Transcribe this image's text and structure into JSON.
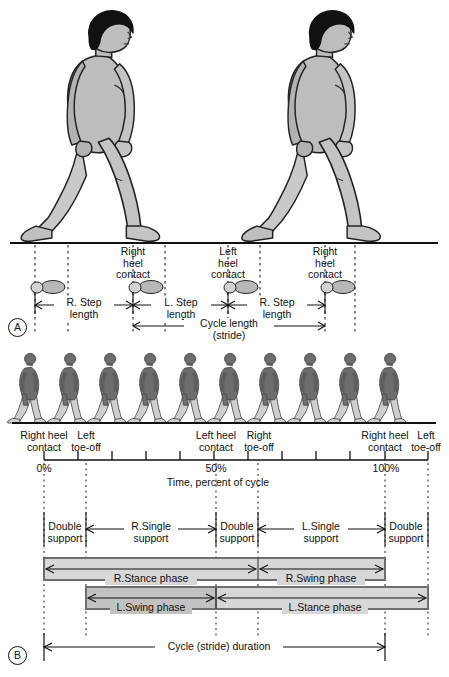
{
  "figure": {
    "panels": [
      {
        "letter": "A",
        "name": "spatial-gait-parameters"
      },
      {
        "letter": "B",
        "name": "temporal-gait-parameters"
      }
    ]
  },
  "panel_a": {
    "letter": "A",
    "event_labels": [
      {
        "text": "Right\nheel\ncontact",
        "x": 133
      },
      {
        "text": "Left\nheel\ncontact",
        "x": 228
      },
      {
        "text": "Right\nheel\ncontact",
        "x": 325
      }
    ],
    "measures": [
      {
        "label": "R. Step\nlength",
        "x1": 35,
        "x2": 133
      },
      {
        "label": "L. Step\nlength",
        "x1": 133,
        "x2": 228
      },
      {
        "label": "R. Step\nlength",
        "x1": 228,
        "x2": 325
      }
    ],
    "cycle": {
      "label": "Cycle length\n(stride)",
      "x1": 133,
      "x2": 325
    },
    "figure_count": 3,
    "footprint_count": 4,
    "dashed_lines": [
      35,
      68,
      133,
      165,
      228,
      260,
      325,
      355
    ]
  },
  "panel_b": {
    "letter": "B",
    "walker_count": 10,
    "axis": {
      "label": "Time, percent of cycle",
      "ticks": [
        {
          "percent": 0,
          "label": "0%"
        },
        {
          "percent": 10,
          "label": ""
        },
        {
          "percent": 20,
          "label": ""
        },
        {
          "percent": 30,
          "label": ""
        },
        {
          "percent": 40,
          "label": ""
        },
        {
          "percent": 50,
          "label": "50%"
        },
        {
          "percent": 60,
          "label": ""
        },
        {
          "percent": 70,
          "label": ""
        },
        {
          "percent": 80,
          "label": ""
        },
        {
          "percent": 90,
          "label": ""
        },
        {
          "percent": 100,
          "label": "100%"
        },
        {
          "percent": 112,
          "label": ""
        }
      ],
      "range": [
        0,
        112
      ]
    },
    "events": [
      {
        "label": "Right heel\ncontact",
        "percent": 0
      },
      {
        "label": "Left\ntoe-off",
        "percent": 12
      },
      {
        "label": "Left heel\ncontact",
        "percent": 50
      },
      {
        "label": "Right\ntoe-off",
        "percent": 62
      },
      {
        "label": "Right heel\ncontact",
        "percent": 100
      },
      {
        "label": "Left\ntoe-off",
        "percent": 112
      }
    ],
    "support_row": [
      {
        "label": "Double\nsupport",
        "start": 0,
        "end": 12,
        "boxed": true
      },
      {
        "label": "R.Single\nsupport",
        "start": 12,
        "end": 50,
        "boxed": false
      },
      {
        "label": "Double\nsupport",
        "start": 50,
        "end": 62,
        "boxed": true
      },
      {
        "label": "L.Single\nsupport",
        "start": 62,
        "end": 100,
        "boxed": false
      },
      {
        "label": "Double\nsupport",
        "start": 100,
        "end": 112,
        "boxed": true
      }
    ],
    "right_bar": [
      {
        "label": "R.Stance phase",
        "start": 0,
        "end": 62
      },
      {
        "label": "R.Swing phase",
        "start": 62,
        "end": 100
      }
    ],
    "left_bar": [
      {
        "label": "L.Swing phase",
        "start": 12,
        "end": 50
      },
      {
        "label": "L.Stance phase",
        "start": 50,
        "end": 112
      }
    ],
    "duration": {
      "label": "Cycle (stride) duration",
      "start": 0,
      "end": 100
    },
    "dashed_lines": [
      0,
      12,
      50,
      62,
      100,
      112
    ]
  },
  "colors": {
    "ink": "#111111",
    "skin": "#b9b9b9",
    "skin_light": "#c9c9c9",
    "hair": "#111111",
    "bar_fill": "#d7d7d7",
    "bar_stroke": "#6e6e6e",
    "bar_fill_dark": "#c2c2c2",
    "silhouette_dark": "#6d6d6d",
    "silhouette_light": "#cfcfcf",
    "footprint": "#bdbdbd"
  }
}
